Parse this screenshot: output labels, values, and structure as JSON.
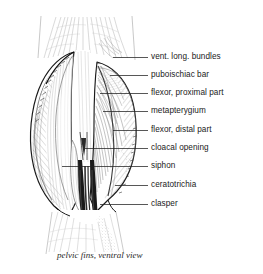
{
  "figure": {
    "title_caption": "pelvic fins, ventral view",
    "ink_color": "#1a1a1a",
    "shade_color": "#9a9a9a",
    "background_color": "#ffffff",
    "labels": [
      {
        "id": "vent-long-bundles",
        "text": "vent. long. bundles",
        "y": 57,
        "line_start_x": 113,
        "line_end_x": 148,
        "text_x": 151
      },
      {
        "id": "puboischiac-bar",
        "text": "puboischiac bar",
        "y": 75,
        "line_start_x": 110,
        "line_end_x": 148,
        "text_x": 151
      },
      {
        "id": "flexor-proximal",
        "text": "flexor, proximal part",
        "y": 93,
        "line_start_x": 100,
        "line_end_x": 148,
        "text_x": 151
      },
      {
        "id": "metapterygium",
        "text": "metapterygium",
        "y": 111,
        "line_start_x": 103,
        "line_end_x": 148,
        "text_x": 151
      },
      {
        "id": "flexor-distal",
        "text": "flexor, distal part",
        "y": 130,
        "line_start_x": 113,
        "line_end_x": 148,
        "text_x": 151
      },
      {
        "id": "cloacal-opening",
        "text": "cloacal opening",
        "y": 148,
        "line_start_x": 85,
        "line_end_x": 148,
        "text_x": 151
      },
      {
        "id": "siphon",
        "text": "siphon",
        "y": 166,
        "line_start_x": 62,
        "line_end_x": 148,
        "text_x": 151
      },
      {
        "id": "ceratotrichia",
        "text": "ceratotrichia",
        "y": 185,
        "line_start_x": 115,
        "line_end_x": 148,
        "text_x": 151
      },
      {
        "id": "clasper",
        "text": "clasper",
        "y": 204,
        "line_start_x": 100,
        "line_end_x": 148,
        "text_x": 151
      }
    ]
  }
}
